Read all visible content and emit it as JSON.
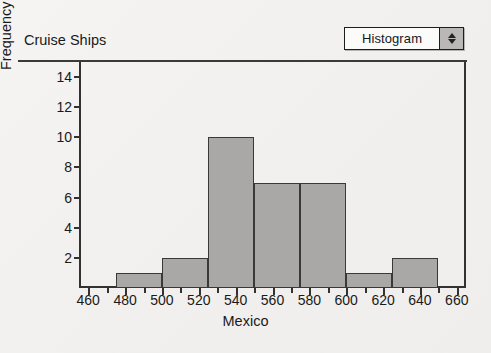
{
  "window": {
    "background_color": "#f1f0ee"
  },
  "toolbar": {
    "plot_type_select": {
      "value": "Histogram",
      "stepper_up_icon": "triangle-up-icon",
      "stepper_down_icon": "triangle-down-icon"
    }
  },
  "chart_data": {
    "type": "bar",
    "title": "Cruise Ships",
    "xlabel": "Mexico",
    "ylabel": "Frequency of Mexico",
    "bin_width": 25,
    "bin_edges": [
      475,
      500,
      525,
      550,
      575,
      600,
      625,
      650
    ],
    "categories": [
      "475-500",
      "500-525",
      "525-550",
      "550-575",
      "575-600",
      "600-625",
      "625-650"
    ],
    "values": [
      1,
      2,
      10,
      7,
      7,
      1,
      2
    ],
    "xlim": [
      455,
      665
    ],
    "ylim": [
      0,
      15
    ],
    "xticks": [
      460,
      480,
      500,
      520,
      540,
      560,
      580,
      600,
      620,
      640,
      660
    ],
    "xtick_labels": [
      "460",
      "480",
      "500",
      "520",
      "540",
      "560",
      "580",
      "600",
      "620",
      "640",
      "660"
    ],
    "x_minor_tick_step": 10,
    "yticks": [
      2,
      4,
      6,
      8,
      10,
      12,
      14
    ],
    "ytick_labels": [
      "2",
      "4",
      "6",
      "8",
      "10",
      "12",
      "14"
    ],
    "grid": false,
    "legend": "none",
    "bar_fill_color": "#a9a8a6",
    "bar_edge_color": "#3a3936"
  }
}
